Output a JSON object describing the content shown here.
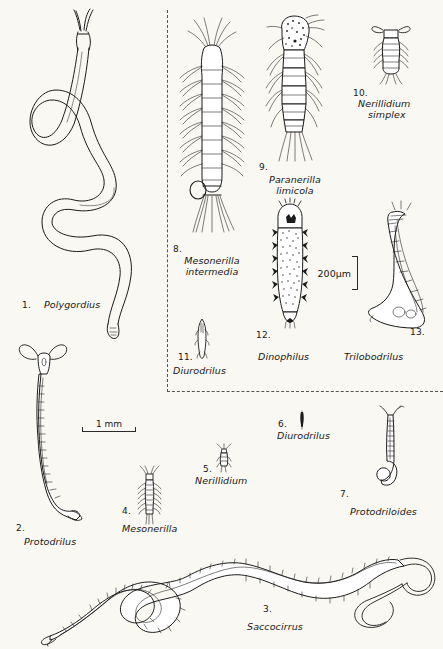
{
  "plate": {
    "title": "Interstitial polychaete annelids comparative plate",
    "background_color": "#faf8f2",
    "ink_color": "#1b1b1b",
    "inset_box": {
      "name": "dashed-inset-box",
      "border_style": "dashed",
      "border_color": "#555555",
      "note": "encloses the higher-magnification figures 8 to 13"
    }
  },
  "scale_bars": [
    {
      "id": "scale-1mm",
      "label": "1 mm",
      "orientation": "horizontal",
      "applies_to": "figures 1-7 (outside dashed box)"
    },
    {
      "id": "scale-200um",
      "label": "200µm",
      "orientation": "vertical",
      "applies_to": "figures 8-13 (inside dashed box)"
    }
  ],
  "figures": [
    {
      "number": "1.",
      "genus": "Polygordius",
      "epithet": "",
      "region": "outside-box",
      "icon": "coiled-threadlike-worm"
    },
    {
      "number": "2.",
      "genus": "Protodrilus",
      "epithet": "",
      "region": "outside-box",
      "icon": "slender-sinuous-worm"
    },
    {
      "number": "3.",
      "genus": "Saccocirrus",
      "epithet": "",
      "region": "outside-box",
      "icon": "large-coiled-bristled-worm"
    },
    {
      "number": "4.",
      "genus": "Mesonerilla",
      "epithet": "",
      "region": "outside-box",
      "icon": "small-bristled-worm"
    },
    {
      "number": "5.",
      "genus": "Nerillidium",
      "epithet": "",
      "region": "outside-box",
      "icon": "minute-worm"
    },
    {
      "number": "6.",
      "genus": "Diurodrilus",
      "epithet": "",
      "region": "outside-box",
      "icon": "minute-rod-worm"
    },
    {
      "number": "7.",
      "genus": "Protodriloides",
      "epithet": "",
      "region": "outside-box",
      "icon": "hook-tailed-worm"
    },
    {
      "number": "8.",
      "genus": "Mesonerilla",
      "epithet": "intermedia",
      "region": "inside-box",
      "icon": "parapodia-bristled-worm"
    },
    {
      "number": "9.",
      "genus": "Paranerilla",
      "epithet": "limicola",
      "region": "inside-box",
      "icon": "segmented-bristled-worm"
    },
    {
      "number": "10.",
      "genus": "Nerillidium",
      "epithet": "simplex",
      "region": "inside-box",
      "icon": "small-ciliated-worm"
    },
    {
      "number": "11.",
      "genus": "Diurodrilus",
      "epithet": "",
      "region": "inside-box",
      "icon": "spindle-shaped-worm"
    },
    {
      "number": "12.",
      "genus": "Dinophilus",
      "epithet": "",
      "region": "inside-box",
      "icon": "stippled-ciliated-worm"
    },
    {
      "number": "13.",
      "genus": "Trilobodrilus",
      "epithet": "",
      "region": "inside-box",
      "icon": "curved-segmented-worm"
    }
  ]
}
